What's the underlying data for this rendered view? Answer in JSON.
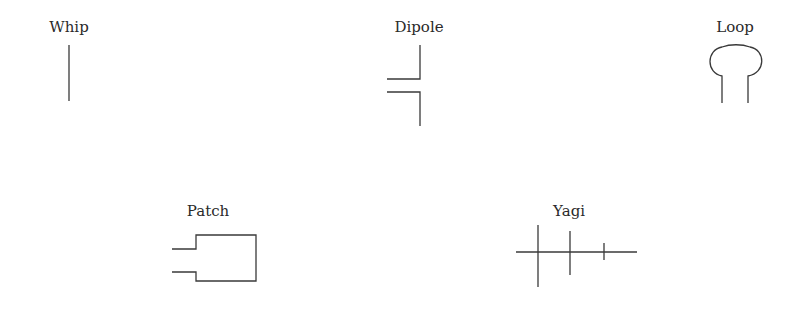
{
  "diagram": {
    "antennas": [
      {
        "id": "whip",
        "label": "Whip"
      },
      {
        "id": "dipole",
        "label": "Dipole"
      },
      {
        "id": "loop",
        "label": "Loop"
      },
      {
        "id": "patch",
        "label": "Patch"
      },
      {
        "id": "yagi",
        "label": "Yagi"
      }
    ],
    "colors": {
      "line": "#3a3a3a",
      "text": "#2a2a2a",
      "background": "#ffffff"
    }
  }
}
